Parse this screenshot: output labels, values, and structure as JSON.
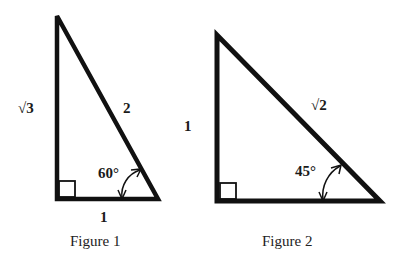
{
  "figures": [
    {
      "caption": "Figure 1",
      "type": "30-60-90 right triangle",
      "labels": {
        "vertical_side": "√3",
        "hypotenuse": "2",
        "base": "1",
        "angle": "60°"
      }
    },
    {
      "caption": "Figure 2",
      "type": "45-45-90 right triangle",
      "labels": {
        "vertical_side": "1",
        "hypotenuse": "√2",
        "angle": "45°"
      }
    }
  ],
  "colors": {
    "stroke": "#111111",
    "background": "#ffffff"
  }
}
